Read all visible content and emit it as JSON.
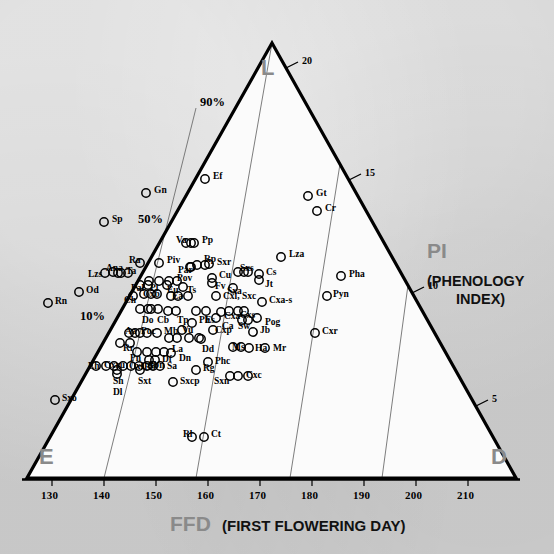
{
  "figure": {
    "vertices": {
      "top": "L",
      "bottom_left": "E",
      "bottom_right": "D"
    },
    "axis_bottom": {
      "abbrev": "FFD",
      "full": "(FIRST FLOWERING DAY)"
    },
    "axis_right": {
      "abbrev": "PI",
      "full_line1": "(PHENOLOGY",
      "full_line2": "INDEX)"
    },
    "colors": {
      "background": "#d2d2d2",
      "plot_fill": "#fbfbfb",
      "outline": "#000000",
      "gridline": "#6e6e6e",
      "vertex_text": "#8a8a8a",
      "axis_title_grey": "#8a8a8a",
      "axis_title_black": "#111111"
    }
  },
  "chart_data": {
    "type": "scatter",
    "title": "",
    "xlabel": "FFD (FIRST FLOWERING DAY)",
    "ylabel": "PI (PHENOLOGY INDEX)",
    "grid": true,
    "legend_position": "none",
    "ternary": true,
    "ternary_vertices": [
      "L",
      "E",
      "D"
    ],
    "x_ticks": [
      130,
      140,
      150,
      160,
      170,
      180,
      190,
      200,
      210
    ],
    "xlim": [
      125,
      214
    ],
    "pi_ticks": [
      20,
      15,
      10,
      5
    ],
    "percent_ticks": [
      "90%",
      "50%",
      "10%"
    ],
    "n_points": 118,
    "points": [
      {
        "label": "Ef",
        "x": 155.0,
        "pi": 17.4,
        "px": 205,
        "py": 179,
        "lx": 213,
        "ly": 172
      },
      {
        "label": "Gn",
        "x": 145.0,
        "pi": 17.0,
        "px": 146,
        "py": 193,
        "lx": 154,
        "ly": 186
      },
      {
        "label": "Gt",
        "x": 175.0,
        "pi": 15.8,
        "px": 308,
        "py": 196,
        "lx": 316,
        "ly": 189
      },
      {
        "label": "Cr",
        "x": 176.5,
        "pi": 15.2,
        "px": 317,
        "py": 211,
        "lx": 325,
        "ly": 204
      },
      {
        "label": "Sp",
        "x": 135.5,
        "pi": 15.5,
        "px": 104,
        "py": 222,
        "lx": 112,
        "ly": 215
      },
      {
        "label": "Va",
        "x": 153.0,
        "pi": 13.2,
        "px": 186,
        "py": 243,
        "lx": 176,
        "ly": 236
      },
      {
        "label": "Pp",
        "x": 154.5,
        "pi": 13.2,
        "px": 194,
        "py": 243,
        "lx": 202,
        "ly": 236
      },
      {
        "label": "Lza",
        "x": 170.0,
        "pi": 12.6,
        "px": 281,
        "py": 257,
        "lx": 289,
        "ly": 250
      },
      {
        "label": "Ra",
        "x": 145.5,
        "pi": 12.4,
        "px": 140,
        "py": 263,
        "lx": 129,
        "ly": 256
      },
      {
        "label": "Piv",
        "x": 148.5,
        "pi": 12.4,
        "px": 159,
        "py": 263,
        "lx": 167,
        "ly": 256
      },
      {
        "label": "Rp",
        "x": 155.0,
        "pi": 12.3,
        "px": 197,
        "py": 265,
        "lx": 204,
        "ly": 255
      },
      {
        "label": "Par",
        "x": 154.0,
        "pi": 12.1,
        "px": 190,
        "py": 267,
        "lx": 178,
        "ly": 266
      },
      {
        "label": "Sxr",
        "x": 157.5,
        "pi": 12.1,
        "px": 209,
        "py": 264,
        "lx": 217,
        "ly": 258
      },
      {
        "label": "Ana",
        "x": 139.5,
        "pi": 11.9,
        "px": 113,
        "py": 272,
        "lx": 106,
        "ly": 264
      },
      {
        "label": "Ta",
        "x": 141.0,
        "pi": 11.8,
        "px": 121,
        "py": 273,
        "lx": 126,
        "ly": 267
      },
      {
        "label": "Lzs",
        "x": 138.0,
        "pi": 11.8,
        "px": 105,
        "py": 273,
        "lx": 88,
        "ly": 270
      },
      {
        "label": "Sxs",
        "x": 163.5,
        "pi": 11.7,
        "px": 244,
        "py": 272,
        "lx": 240,
        "ly": 264
      },
      {
        "label": "Cs",
        "x": 166.5,
        "pi": 11.5,
        "px": 259,
        "py": 274,
        "lx": 266,
        "ly": 268
      },
      {
        "label": "Jt",
        "x": 166.5,
        "pi": 11.2,
        "px": 259,
        "py": 280,
        "lx": 265,
        "ly": 280
      },
      {
        "label": "Pha",
        "x": 181.5,
        "pi": 11.0,
        "px": 341,
        "py": 276,
        "lx": 349,
        "ly": 270
      },
      {
        "label": "Pov",
        "x": 151.5,
        "pi": 11.2,
        "px": 177,
        "py": 281,
        "lx": 177,
        "ly": 274
      },
      {
        "label": "Cu",
        "x": 158.5,
        "pi": 11.3,
        "px": 212,
        "py": 278,
        "lx": 219,
        "ly": 271
      },
      {
        "label": "Fv",
        "x": 158.5,
        "pi": 11.0,
        "px": 212,
        "py": 283,
        "lx": 215,
        "ly": 282
      },
      {
        "label": "Pal",
        "x": 144.5,
        "pi": 10.9,
        "px": 140,
        "py": 285,
        "lx": 131,
        "ly": 284
      },
      {
        "label": "Pl",
        "x": 146.0,
        "pi": 10.9,
        "px": 148,
        "py": 285,
        "lx": 150,
        "ly": 284
      },
      {
        "label": "Eu",
        "x": 149.5,
        "pi": 10.9,
        "px": 167,
        "py": 285,
        "lx": 167,
        "ly": 286
      },
      {
        "label": "Ts",
        "x": 152.5,
        "pi": 10.8,
        "px": 183,
        "py": 287,
        "lx": 187,
        "ly": 286
      },
      {
        "label": "Sxa",
        "x": 161.5,
        "pi": 10.7,
        "px": 233,
        "py": 288,
        "lx": 227,
        "ly": 287
      },
      {
        "label": "Pyn",
        "x": 179.0,
        "pi": 9.9,
        "px": 327,
        "py": 296,
        "lx": 333,
        "ly": 290
      },
      {
        "label": "Ch",
        "x": 143.0,
        "pi": 10.3,
        "px": 133,
        "py": 296,
        "lx": 124,
        "ly": 296
      },
      {
        "label": "Cxb",
        "x": 145.0,
        "pi": 10.4,
        "px": 144,
        "py": 294,
        "lx": 143,
        "ly": 290
      },
      {
        "label": "Ea",
        "x": 150.0,
        "pi": 10.3,
        "px": 171,
        "py": 296,
        "lx": 172,
        "ly": 292
      },
      {
        "label": "Cxl, Sxc",
        "x": 159.5,
        "pi": 10.2,
        "px": 216,
        "py": 296,
        "lx": 223,
        "ly": 292
      },
      {
        "label": "Cxa-s",
        "x": 167.5,
        "pi": 9.8,
        "px": 262,
        "py": 302,
        "lx": 269,
        "ly": 296
      },
      {
        "label": "Do",
        "x": 144.0,
        "pi": 9.7,
        "px": 140,
        "py": 309,
        "lx": 142,
        "ly": 316
      },
      {
        "label": "Cb",
        "x": 146.0,
        "pi": 9.7,
        "px": 151,
        "py": 309,
        "lx": 157,
        "ly": 316
      },
      {
        "label": "Tp",
        "x": 149.0,
        "pi": 9.6,
        "px": 168,
        "py": 311,
        "lx": 177,
        "ly": 316
      },
      {
        "label": "Es",
        "x": 156.5,
        "pi": 9.6,
        "px": 206,
        "py": 311,
        "lx": 205,
        "ly": 316
      },
      {
        "label": "Cxa",
        "x": 159.5,
        "pi": 9.5,
        "px": 221,
        "py": 312,
        "lx": 224,
        "ly": 312
      },
      {
        "label": "Cxs",
        "x": 162.5,
        "pi": 9.5,
        "px": 238,
        "py": 311,
        "lx": 240,
        "ly": 311
      },
      {
        "label": "Ca",
        "x": 158.5,
        "pi": 9.1,
        "px": 216,
        "py": 318,
        "lx": 222,
        "ly": 322
      },
      {
        "label": "Sw",
        "x": 163.5,
        "pi": 9.0,
        "px": 242,
        "py": 320,
        "lx": 238,
        "ly": 322
      },
      {
        "label": "Pog",
        "x": 166.0,
        "pi": 9.1,
        "px": 257,
        "py": 318,
        "lx": 265,
        "ly": 318
      },
      {
        "label": "Ph",
        "x": 154.0,
        "pi": 9.0,
        "px": 192,
        "py": 323,
        "lx": 199,
        "ly": 316
      },
      {
        "label": "Vu",
        "x": 152.0,
        "pi": 8.6,
        "px": 182,
        "py": 330,
        "lx": 182,
        "ly": 326
      },
      {
        "label": "Cxp",
        "x": 158.0,
        "pi": 8.6,
        "px": 213,
        "py": 330,
        "lx": 215,
        "ly": 326
      },
      {
        "label": "Jb",
        "x": 165.0,
        "pi": 8.5,
        "px": 253,
        "py": 332,
        "lx": 260,
        "ly": 326
      },
      {
        "label": "Cxr",
        "x": 176.5,
        "pi": 8.4,
        "px": 315,
        "py": 333,
        "lx": 322,
        "ly": 327
      },
      {
        "label": "Aa",
        "x": 142.0,
        "pi": 8.5,
        "px": 129,
        "py": 333,
        "lx": 125,
        "ly": 327
      },
      {
        "label": "Poc",
        "x": 144.0,
        "pi": 8.5,
        "px": 140,
        "py": 333,
        "lx": 141,
        "ly": 327
      },
      {
        "label": "Mb",
        "x": 147.0,
        "pi": 8.5,
        "px": 157,
        "py": 333,
        "lx": 164,
        "ly": 327
      },
      {
        "label": "La",
        "x": 149.5,
        "pi": 8.2,
        "px": 169,
        "py": 338,
        "lx": 172,
        "ly": 345
      },
      {
        "label": "Dd",
        "x": 155.5,
        "pi": 8.1,
        "px": 201,
        "py": 339,
        "lx": 202,
        "ly": 345
      },
      {
        "label": "Rr",
        "x": 140.5,
        "pi": 8.0,
        "px": 120,
        "py": 343,
        "lx": 123,
        "ly": 344
      },
      {
        "label": "Ms",
        "x": 162.0,
        "pi": 7.7,
        "px": 233,
        "py": 347,
        "lx": 232,
        "ly": 343
      },
      {
        "label": "Ha",
        "x": 165.0,
        "pi": 7.6,
        "px": 249,
        "py": 348,
        "lx": 255,
        "ly": 344
      },
      {
        "label": "Mr",
        "x": 167.5,
        "pi": 7.6,
        "px": 265,
        "py": 348,
        "lx": 273,
        "ly": 344
      },
      {
        "label": "Pn",
        "x": 143.0,
        "pi": 7.5,
        "px": 137,
        "py": 352,
        "lx": 130,
        "ly": 354
      },
      {
        "label": "Df",
        "x": 147.0,
        "pi": 7.5,
        "px": 156,
        "py": 352,
        "lx": 162,
        "ly": 355
      },
      {
        "label": "Dn",
        "x": 149.5,
        "pi": 7.4,
        "px": 171,
        "py": 353,
        "lx": 179,
        "ly": 354
      },
      {
        "label": "Bn",
        "x": 145.5,
        "pi": 7.1,
        "px": 149,
        "py": 360,
        "lx": 144,
        "ly": 363
      },
      {
        "label": "Phc",
        "x": 157.0,
        "pi": 7.0,
        "px": 208,
        "py": 362,
        "lx": 215,
        "ly": 357
      },
      {
        "label": "Eh",
        "x": 135.0,
        "pi": 6.8,
        "px": 96,
        "py": 366,
        "lx": 88,
        "ly": 362
      },
      {
        "label": "Cxru",
        "x": 138.5,
        "pi": 6.8,
        "px": 114,
        "py": 366,
        "lx": 104,
        "ly": 361
      },
      {
        "label": "Cxf",
        "x": 141.5,
        "pi": 6.8,
        "px": 123,
        "py": 366,
        "lx": 129,
        "ly": 362
      },
      {
        "label": "Abn",
        "x": 145.5,
        "pi": 6.8,
        "px": 147,
        "py": 366,
        "lx": 147,
        "ly": 361
      },
      {
        "label": "Sa",
        "x": 148.0,
        "pi": 6.8,
        "px": 160,
        "py": 366,
        "lx": 167,
        "ly": 362
      },
      {
        "label": "Rg",
        "x": 154.5,
        "pi": 6.6,
        "px": 196,
        "py": 370,
        "lx": 203,
        "ly": 364
      },
      {
        "label": "Sh",
        "x": 139.5,
        "pi": 6.5,
        "px": 117,
        "py": 370,
        "lx": 113,
        "ly": 377
      },
      {
        "label": "Sxt",
        "x": 143.5,
        "pi": 6.5,
        "px": 140,
        "py": 370,
        "lx": 138,
        "ly": 377
      },
      {
        "label": "Dl",
        "x": 139.5,
        "pi": 6.2,
        "px": 117,
        "py": 374,
        "lx": 113,
        "ly": 388
      },
      {
        "label": "Sxn",
        "x": 161.5,
        "pi": 6.3,
        "px": 230,
        "py": 376,
        "lx": 214,
        "ly": 377
      },
      {
        "label": "Cxc",
        "x": 165.5,
        "pi": 6.3,
        "px": 248,
        "py": 376,
        "lx": 246,
        "ly": 371
      },
      {
        "label": "Sxcp",
        "x": 150.0,
        "pi": 6.0,
        "px": 173,
        "py": 382,
        "lx": 180,
        "ly": 377
      },
      {
        "label": "Sxo",
        "x": 128.0,
        "pi": 5.4,
        "px": 55,
        "py": 400,
        "lx": 62,
        "ly": 394
      },
      {
        "label": "Rl",
        "x": 154.0,
        "pi": 4.9,
        "px": 192,
        "py": 437,
        "lx": 183,
        "ly": 430
      },
      {
        "label": "Ct",
        "x": 156.0,
        "pi": 4.9,
        "px": 204,
        "py": 437,
        "lx": 211,
        "ly": 430
      },
      {
        "label": "Od",
        "x": 132.5,
        "pi": 10.6,
        "px": 79,
        "py": 292,
        "lx": 86,
        "ly": 286
      },
      {
        "label": "Rn",
        "x": 127.5,
        "pi": 10.2,
        "px": 48,
        "py": 303,
        "lx": 55,
        "ly": 297
      }
    ],
    "note": "Additional unlabeled markers form tight rows in the dense central cluster (see unlabeled_markers)",
    "unlabeled_markers": [
      {
        "px": 118,
        "py": 273
      },
      {
        "px": 128,
        "py": 273
      },
      {
        "px": 191,
        "py": 243
      },
      {
        "px": 205,
        "py": 265
      },
      {
        "px": 191,
        "py": 267
      },
      {
        "px": 149,
        "py": 281
      },
      {
        "px": 159,
        "py": 281
      },
      {
        "px": 169,
        "py": 281
      },
      {
        "px": 248,
        "py": 272
      },
      {
        "px": 238,
        "py": 272
      },
      {
        "px": 151,
        "py": 294
      },
      {
        "px": 157,
        "py": 294
      },
      {
        "px": 178,
        "py": 296
      },
      {
        "px": 188,
        "py": 296
      },
      {
        "px": 148,
        "py": 309
      },
      {
        "px": 158,
        "py": 309
      },
      {
        "px": 176,
        "py": 311
      },
      {
        "px": 196,
        "py": 311
      },
      {
        "px": 229,
        "py": 311
      },
      {
        "px": 244,
        "py": 311
      },
      {
        "px": 248,
        "py": 320
      },
      {
        "px": 135,
        "py": 333
      },
      {
        "px": 147,
        "py": 333
      },
      {
        "px": 177,
        "py": 338
      },
      {
        "px": 189,
        "py": 338
      },
      {
        "px": 199,
        "py": 338
      },
      {
        "px": 130,
        "py": 343
      },
      {
        "px": 241,
        "py": 347
      },
      {
        "px": 147,
        "py": 352
      },
      {
        "px": 164,
        "py": 352
      },
      {
        "px": 155,
        "py": 360
      },
      {
        "px": 106,
        "py": 366
      },
      {
        "px": 131,
        "py": 366
      },
      {
        "px": 139,
        "py": 366
      },
      {
        "px": 153,
        "py": 366
      },
      {
        "px": 238,
        "py": 376
      }
    ]
  }
}
